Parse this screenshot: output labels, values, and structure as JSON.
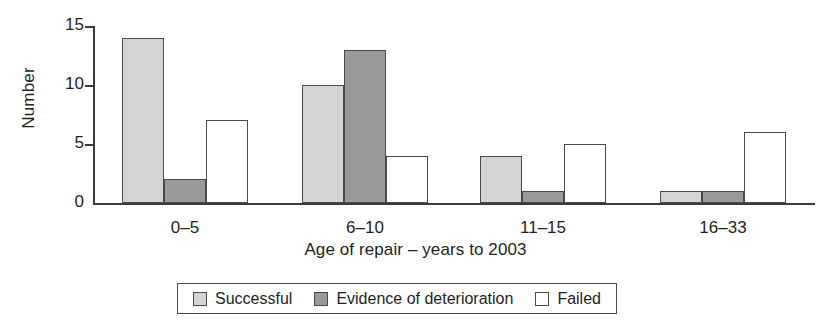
{
  "chart_data": {
    "type": "bar",
    "title": "",
    "subtitle": "",
    "xlabel": "Age of repair – years to 2003",
    "ylabel": "Number",
    "categories": [
      "0–5",
      "6–10",
      "11–15",
      "16–33"
    ],
    "series": [
      {
        "name": "Successful",
        "color": "#d5d4d2",
        "values": [
          14,
          10,
          4,
          1
        ]
      },
      {
        "name": "Evidence of deterioration",
        "color": "#9b9a98",
        "values": [
          2,
          13,
          1,
          1
        ]
      },
      {
        "name": "Failed",
        "color": "#ffffff",
        "values": [
          7,
          4,
          5,
          6
        ]
      }
    ],
    "ylim": [
      0,
      15
    ],
    "yticks": [
      0,
      5,
      10,
      15
    ],
    "ytick_labels": [
      "0",
      "5",
      "10",
      "15"
    ],
    "grid": false,
    "legend_position": "bottom",
    "axis_color": "#3b3b3b",
    "bar_edge_color": "#4a4a4a",
    "background": "#ffffff"
  },
  "legend": {
    "items": [
      {
        "label": "Successful",
        "swatch": "successful"
      },
      {
        "label": "Evidence of deterioration",
        "swatch": "deterioration"
      },
      {
        "label": "Failed",
        "swatch": "failed"
      }
    ]
  }
}
